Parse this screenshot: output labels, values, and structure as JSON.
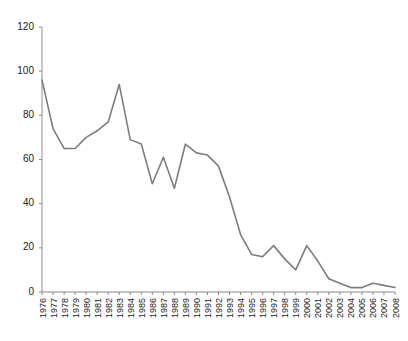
{
  "chart_data": {
    "type": "line",
    "title": "",
    "subtitle": "",
    "xlabel": "",
    "ylabel": "",
    "ylim": [
      0,
      120
    ],
    "yticks": [
      0,
      20,
      40,
      60,
      80,
      100,
      120
    ],
    "grid": false,
    "legend": null,
    "legend_position": "none",
    "line_color": "#7d7d7d",
    "line_width": 1.6,
    "markers": false,
    "categories": [
      "1976",
      "1977",
      "1978",
      "1979",
      "1980",
      "1981",
      "1982",
      "1983",
      "1984",
      "1985",
      "1986",
      "1987",
      "1988",
      "1989",
      "1990",
      "1991",
      "1992",
      "1993",
      "1994",
      "1995",
      "1996",
      "1997",
      "1998",
      "1999",
      "2000",
      "2001",
      "2002",
      "2003",
      "2004",
      "2005",
      "2006",
      "2007",
      "2008"
    ],
    "x": [
      1976,
      1977,
      1978,
      1979,
      1980,
      1981,
      1982,
      1983,
      1984,
      1985,
      1986,
      1987,
      1988,
      1989,
      1990,
      1991,
      1992,
      1993,
      1994,
      1995,
      1996,
      1997,
      1998,
      1999,
      2000,
      2001,
      2002,
      2003,
      2004,
      2005,
      2006,
      2007,
      2008
    ],
    "values": [
      96,
      74,
      65,
      65,
      70,
      73,
      77,
      94,
      69,
      67,
      49,
      61,
      47,
      67,
      63,
      62,
      57,
      43,
      26,
      17,
      16,
      21,
      15,
      10,
      21,
      14,
      6,
      4,
      2,
      2,
      4,
      3,
      2
    ],
    "series": [
      {
        "name": "series-1",
        "color": "#7d7d7d",
        "values": [
          96,
          74,
          65,
          65,
          70,
          73,
          77,
          94,
          69,
          67,
          49,
          61,
          47,
          67,
          63,
          62,
          57,
          43,
          26,
          17,
          16,
          21,
          15,
          10,
          21,
          14,
          6,
          4,
          2,
          2,
          4,
          3,
          2
        ]
      }
    ]
  },
  "axes": {
    "y_tick_labels": [
      "0",
      "20",
      "40",
      "60",
      "80",
      "100",
      "120"
    ],
    "x_tick_labels": [
      "1976",
      "1977",
      "1978",
      "1979",
      "1980",
      "1981",
      "1982",
      "1983",
      "1984",
      "1985",
      "1986",
      "1987",
      "1988",
      "1989",
      "1990",
      "1991",
      "1992",
      "1993",
      "1994",
      "1995",
      "1996",
      "1997",
      "1998",
      "1999",
      "2000",
      "2001",
      "2002",
      "2003",
      "2004",
      "2005",
      "2006",
      "2007",
      "2008"
    ]
  }
}
